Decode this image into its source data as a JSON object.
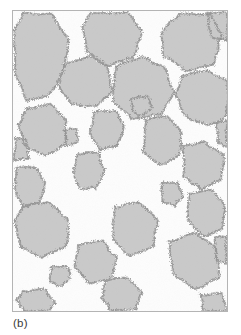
{
  "figure": {
    "caption": "(b)",
    "panel_label": "b",
    "background_color": "#ffffff",
    "frame_border_color": "#b4b4b4",
    "matrix_color": "#fdfdfd",
    "grain_fill_color": "#c9c9c9",
    "grain_edge_color": "#9a9a9a",
    "stipple_color": "#8a8a8a",
    "frame": {
      "x": 12,
      "y": 10,
      "width": 216,
      "height": 302
    },
    "image_size": {
      "width": 241,
      "height": 335
    }
  },
  "chart_data": {
    "type": "scatter",
    "title": "(b)",
    "xlabel": "",
    "ylabel": "",
    "xlim": [
      0,
      216
    ],
    "ylim": [
      0,
      302
    ],
    "grid": false,
    "legend": null,
    "grain_count": 28,
    "grains": [
      {
        "id": 1,
        "cx": 32,
        "cy": 38,
        "area_px": 3900,
        "points": "10,2 40,4 56,30 52,62 36,86 14,90 2,62 2,18"
      },
      {
        "id": 2,
        "cx": 104,
        "cy": 26,
        "area_px": 2600,
        "points": "78,2 116,2 130,20 122,46 96,56 74,40 70,16"
      },
      {
        "id": 3,
        "cx": 176,
        "cy": 30,
        "area_px": 3000,
        "points": "150,22 168,2 200,4 210,24 204,54 174,60 152,46"
      },
      {
        "id": 4,
        "cx": 212,
        "cy": 14,
        "area_px": 900,
        "points": "196,2 216,2 216,30 200,26"
      },
      {
        "id": 5,
        "cx": 74,
        "cy": 70,
        "area_px": 2400,
        "points": "52,54 78,46 96,56 100,80 84,96 58,94 46,76"
      },
      {
        "id": 6,
        "cx": 130,
        "cy": 72,
        "area_px": 3600,
        "points": "104,56 130,46 154,58 162,82 150,104 120,108 100,90"
      },
      {
        "id": 7,
        "cx": 196,
        "cy": 84,
        "area_px": 3400,
        "points": "170,66 196,60 216,70 216,106 196,116 174,106 164,84"
      },
      {
        "id": 8,
        "cx": 36,
        "cy": 116,
        "area_px": 2800,
        "points": "14,98 38,94 54,110 52,134 32,146 12,136 6,114"
      },
      {
        "id": 9,
        "cx": 96,
        "cy": 118,
        "area_px": 1700,
        "points": "82,102 104,100 112,116 106,136 88,140 78,124"
      },
      {
        "id": 10,
        "cx": 128,
        "cy": 96,
        "area_px": 600,
        "points": "120,88 136,86 140,98 130,106 120,100"
      },
      {
        "id": 11,
        "cx": 150,
        "cy": 128,
        "area_px": 2900,
        "points": "134,110 156,106 170,122 168,146 148,156 132,142"
      },
      {
        "id": 12,
        "cx": 78,
        "cy": 160,
        "area_px": 1500,
        "points": "66,144 86,142 92,160 84,178 68,178 60,162"
      },
      {
        "id": 13,
        "cx": 20,
        "cy": 176,
        "area_px": 1600,
        "points": "4,158 22,156 32,172 28,192 10,198 2,180"
      },
      {
        "id": 14,
        "cx": 190,
        "cy": 152,
        "area_px": 2700,
        "points": "172,136 194,132 212,146 210,170 190,180 172,166"
      },
      {
        "id": 15,
        "cx": 36,
        "cy": 216,
        "area_px": 3300,
        "points": "10,196 36,192 56,210 54,236 30,248 8,238 2,214"
      },
      {
        "id": 16,
        "cx": 196,
        "cy": 202,
        "area_px": 2600,
        "points": "178,184 200,180 214,196 212,220 192,228 176,210"
      },
      {
        "id": 17,
        "cx": 126,
        "cy": 216,
        "area_px": 3200,
        "points": "102,198 128,192 146,210 142,236 118,246 100,230"
      },
      {
        "id": 18,
        "cx": 182,
        "cy": 250,
        "area_px": 3500,
        "points": "158,232 184,224 206,240 208,268 184,280 162,266"
      },
      {
        "id": 19,
        "cx": 84,
        "cy": 252,
        "area_px": 2400,
        "points": "66,236 90,232 104,248 100,268 78,274 62,258"
      },
      {
        "id": 20,
        "cx": 160,
        "cy": 184,
        "area_px": 900,
        "points": "150,174 166,172 172,186 164,196 152,192"
      },
      {
        "id": 21,
        "cx": 46,
        "cy": 268,
        "area_px": 700,
        "points": "38,258 54,256 58,268 48,278 38,272"
      },
      {
        "id": 22,
        "cx": 112,
        "cy": 288,
        "area_px": 2200,
        "points": "94,272 116,268 130,284 124,300 100,302 90,288"
      },
      {
        "id": 23,
        "cx": 28,
        "cy": 296,
        "area_px": 1400,
        "points": "10,282 32,280 42,294 36,302 12,302 4,292"
      },
      {
        "id": 24,
        "cx": 204,
        "cy": 298,
        "area_px": 1100,
        "points": "190,286 212,284 216,302 192,302"
      },
      {
        "id": 25,
        "cx": 10,
        "cy": 140,
        "area_px": 500,
        "points": "2,128 14,130 16,148 2,150"
      },
      {
        "id": 26,
        "cx": 214,
        "cy": 122,
        "area_px": 500,
        "points": "206,112 216,110 216,136 206,132"
      },
      {
        "id": 27,
        "cx": 58,
        "cy": 128,
        "area_px": 400,
        "points": "52,120 64,118 66,132 54,136"
      },
      {
        "id": 28,
        "cx": 214,
        "cy": 240,
        "area_px": 700,
        "points": "204,228 216,226 216,254 206,250"
      }
    ]
  }
}
